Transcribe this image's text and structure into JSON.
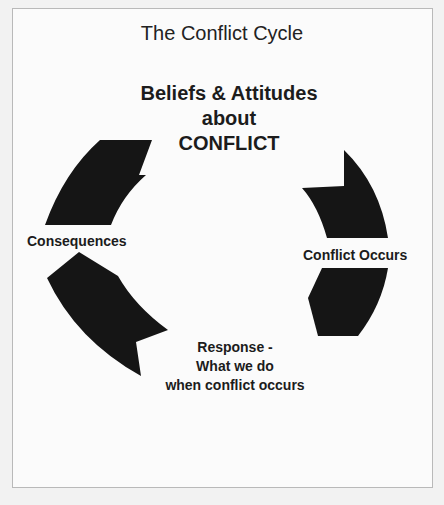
{
  "diagram": {
    "title": "The Conflict Cycle",
    "center": {
      "line1": "Beliefs & Attitudes",
      "line2": "about",
      "line3": "CONFLICT"
    },
    "stages": {
      "conflict_occurs": "Conflict Occurs",
      "response": {
        "line1": "Response -",
        "line2": "What we do",
        "line3": "when conflict occurs"
      },
      "consequences": "Consequences"
    },
    "colors": {
      "arrow": "#151515",
      "text": "#1c1c1c",
      "background": "#fbfbfb",
      "border": "#b9b9b9"
    }
  }
}
